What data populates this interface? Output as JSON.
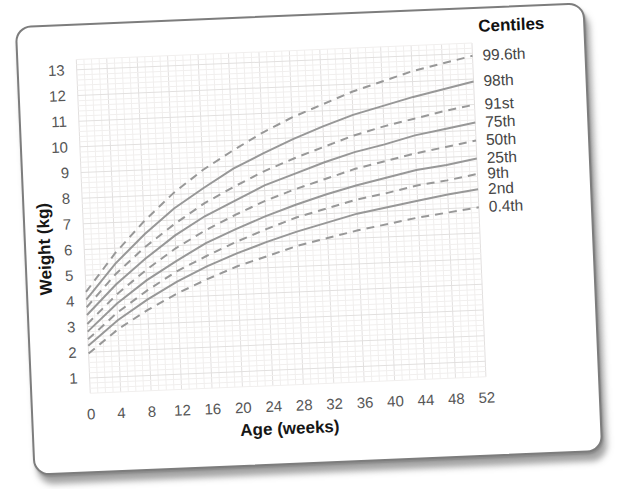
{
  "chart_data": {
    "type": "line",
    "title": "",
    "legend_title": "Centiles",
    "xlabel": "Age (weeks)",
    "ylabel": "Weight (kg)",
    "xlim": [
      0,
      52
    ],
    "ylim": [
      0.4,
      13.4
    ],
    "x_ticks": [
      0,
      4,
      8,
      12,
      16,
      20,
      24,
      28,
      32,
      36,
      40,
      44,
      48,
      52
    ],
    "y_ticks": [
      1,
      2,
      3,
      4,
      5,
      6,
      7,
      8,
      9,
      10,
      11,
      12,
      13
    ],
    "grid": "on",
    "x_minor_step": 1,
    "y_minor_step": 0.2,
    "legend_position": "right-of-curve-ends",
    "line_color": "#989898",
    "grid_minor_color": "#f1efee",
    "grid_major_color": "#e2e0df",
    "tick_label_color": "#565656",
    "centile_label_color": "#454545",
    "x": [
      0,
      4,
      8,
      12,
      16,
      20,
      24,
      28,
      32,
      36,
      40,
      44,
      48,
      52
    ],
    "series": [
      {
        "name": "99.6th",
        "style": "dashed",
        "values": [
          4.35,
          5.8,
          7.0,
          8.05,
          8.9,
          9.6,
          10.25,
          10.8,
          11.25,
          11.7,
          12.05,
          12.4,
          12.65,
          12.9
        ]
      },
      {
        "name": "98th",
        "style": "solid",
        "values": [
          4.05,
          5.4,
          6.5,
          7.45,
          8.2,
          8.9,
          9.45,
          9.95,
          10.4,
          10.8,
          11.1,
          11.4,
          11.65,
          11.9
        ]
      },
      {
        "name": "91st",
        "style": "dashed",
        "values": [
          3.75,
          5.0,
          6.0,
          6.85,
          7.6,
          8.2,
          8.75,
          9.2,
          9.6,
          10.0,
          10.3,
          10.55,
          10.8,
          11.0
        ]
      },
      {
        "name": "75th",
        "style": "solid",
        "values": [
          3.45,
          4.6,
          5.55,
          6.4,
          7.1,
          7.65,
          8.2,
          8.6,
          9.0,
          9.35,
          9.6,
          9.9,
          10.1,
          10.3
        ]
      },
      {
        "name": "50th",
        "style": "dashed",
        "values": [
          3.1,
          4.2,
          5.1,
          5.9,
          6.55,
          7.1,
          7.6,
          8.0,
          8.35,
          8.7,
          8.95,
          9.2,
          9.4,
          9.6
        ]
      },
      {
        "name": "25th",
        "style": "solid",
        "values": [
          2.8,
          3.85,
          4.7,
          5.4,
          6.05,
          6.55,
          7.0,
          7.4,
          7.75,
          8.05,
          8.3,
          8.55,
          8.7,
          8.9
        ]
      },
      {
        "name": "9th",
        "style": "dashed",
        "values": [
          2.5,
          3.5,
          4.3,
          5.0,
          5.55,
          6.05,
          6.5,
          6.9,
          7.2,
          7.5,
          7.7,
          7.95,
          8.1,
          8.3
        ]
      },
      {
        "name": "2nd",
        "style": "solid",
        "values": [
          2.25,
          3.2,
          3.95,
          4.6,
          5.15,
          5.6,
          6.0,
          6.35,
          6.65,
          6.95,
          7.15,
          7.35,
          7.55,
          7.7
        ]
      },
      {
        "name": "0.4th",
        "style": "dashed",
        "values": [
          1.95,
          2.85,
          3.55,
          4.15,
          4.65,
          5.1,
          5.45,
          5.8,
          6.05,
          6.3,
          6.5,
          6.7,
          6.85,
          7.0
        ]
      }
    ]
  }
}
